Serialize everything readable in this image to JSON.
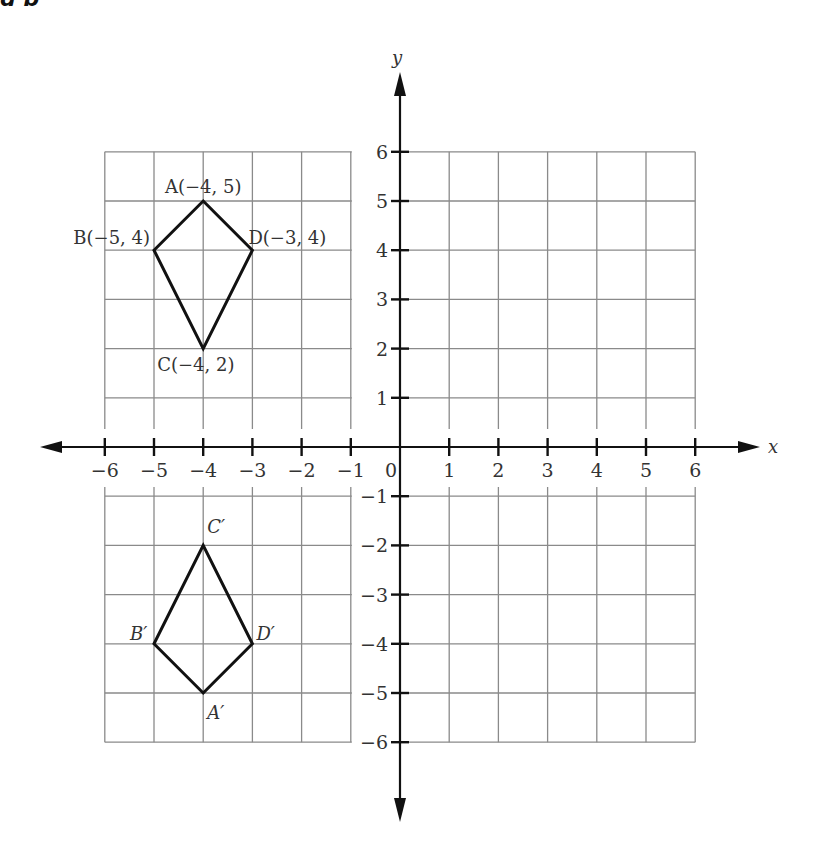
{
  "header_fragment": "g  p",
  "chart_data": {
    "type": "scatter",
    "title": "",
    "xlabel": "x",
    "ylabel": "y",
    "xlim": [
      -6,
      6
    ],
    "ylim": [
      -6,
      6
    ],
    "grid": true,
    "x_ticks": [
      "-6",
      "-5",
      "-4",
      "-3",
      "-2",
      "-1",
      "0",
      "1",
      "2",
      "3",
      "4",
      "5",
      "6"
    ],
    "y_ticks": [
      "6",
      "5",
      "4",
      "3",
      "2",
      "1",
      "-1",
      "-2",
      "-3",
      "-4",
      "-5",
      "-6"
    ],
    "series": [
      {
        "name": "ABCD",
        "closed": true,
        "points": [
          {
            "label": "A(−4, 5)",
            "x": -4,
            "y": 5
          },
          {
            "label": "D(−3, 4)",
            "x": -3,
            "y": 4
          },
          {
            "label": "C(−4, 2)",
            "x": -4,
            "y": 2
          },
          {
            "label": "B(−5, 4)",
            "x": -5,
            "y": 4
          }
        ]
      },
      {
        "name": "A'B'C'D'",
        "closed": true,
        "points": [
          {
            "label": "A′",
            "x": -4,
            "y": -5
          },
          {
            "label": "D′",
            "x": -3,
            "y": -4
          },
          {
            "label": "C′",
            "x": -4,
            "y": -2
          },
          {
            "label": "B′",
            "x": -5,
            "y": -4
          }
        ]
      }
    ]
  },
  "labels": {
    "x_axis": "x",
    "y_axis": "y",
    "origin": "0",
    "A": "A(−4, 5)",
    "B": "B(−5, 4)",
    "C": "C(−4, 2)",
    "D": "D(−3, 4)",
    "A_prime": "A′",
    "B_prime": "B′",
    "C_prime": "C′",
    "D_prime": "D′"
  }
}
